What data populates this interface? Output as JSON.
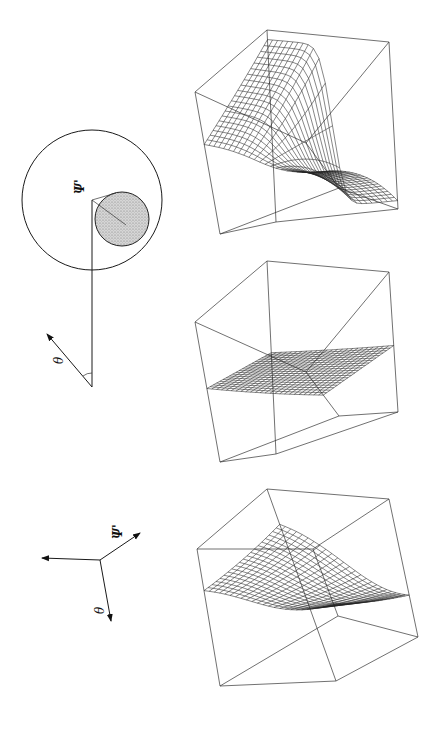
{
  "figure": {
    "orientation": "rotated-90-ccw",
    "page_mark": ""
  },
  "circle_diagram": {
    "outer_circle": {
      "cx": 92,
      "cy": 200,
      "r": 70
    },
    "shaded_circle": {
      "cx": 122,
      "cy": 219,
      "r": 27,
      "fill": "#c8c8c8"
    },
    "vertical_line": {
      "x": 92,
      "y1": 200,
      "y2": 387
    },
    "theta_arrow": {
      "x1": 92,
      "y1": 387,
      "x2": 47,
      "y2": 334
    },
    "labels": {
      "psi": "Ψ'",
      "theta": "θ"
    }
  },
  "axes_diagram": {
    "origin": {
      "x": 100,
      "y": 560
    },
    "axes": [
      {
        "name": "vertical-axis",
        "to": {
          "x": 42,
          "y": 558
        },
        "label": ""
      },
      {
        "name": "psi-axis",
        "to": {
          "x": 140,
          "y": 533
        },
        "label": "Ψ'"
      },
      {
        "name": "theta-axis",
        "to": {
          "x": 111,
          "y": 621
        },
        "label": "θ"
      }
    ]
  },
  "surface_plots": [
    {
      "name": "surface-plot-top",
      "description": "wireframe surface with sharp fold in bounding cube",
      "cube": {
        "front": [
          [
            195,
            92
          ],
          [
            267,
            30
          ],
          [
            389,
            42
          ],
          [
            306,
            143
          ]
        ],
        "back": [
          [
            220,
            234
          ],
          [
            276,
            222
          ],
          [
            398,
            209
          ],
          [
            339,
            188
          ]
        ]
      },
      "surface_type": "fold"
    },
    {
      "name": "surface-plot-middle",
      "description": "nearly planar wireframe surface in bounding cube",
      "cube": {
        "front": [
          [
            195,
            322
          ],
          [
            267,
            261
          ],
          [
            389,
            272
          ],
          [
            306,
            372
          ]
        ],
        "back": [
          [
            220,
            462
          ],
          [
            276,
            454
          ],
          [
            398,
            412
          ],
          [
            339,
            416
          ]
        ]
      },
      "surface_type": "plane"
    },
    {
      "name": "surface-plot-bottom",
      "description": "smoothly curved wireframe surface in bounding cube",
      "cube": {
        "front": [
          [
            197,
            549
          ],
          [
            267,
            489
          ],
          [
            389,
            499
          ],
          [
            313,
            549
          ]
        ],
        "back": [
          [
            220,
            686
          ],
          [
            336,
            681
          ],
          [
            418,
            637
          ],
          [
            338,
            616
          ]
        ]
      },
      "surface_type": "curve"
    }
  ]
}
